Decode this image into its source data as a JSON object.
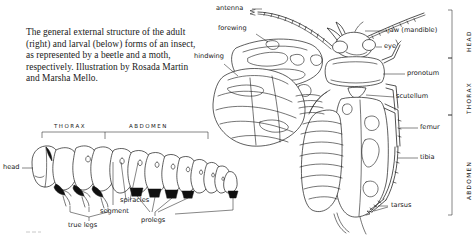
{
  "caption": {
    "text": "The general external structure of the adult (right) and larval (below) forms of an insect, as represented by a beetle and a moth, respectively. Illustration by Rosada Martin and Marsha Mello."
  },
  "figure": {
    "adult_beetle": {
      "labels_left": [
        {
          "id": "antenna",
          "text": "antenna"
        },
        {
          "id": "forewing",
          "text": "forewing"
        },
        {
          "id": "hindwing",
          "text": "hindwing"
        }
      ],
      "labels_right": [
        {
          "id": "jaw",
          "text": "jaw (mandible)"
        },
        {
          "id": "eye",
          "text": "eye"
        },
        {
          "id": "pronotum",
          "text": "pronotum"
        },
        {
          "id": "scutellum",
          "text": "scutellum"
        },
        {
          "id": "femur",
          "text": "femur"
        },
        {
          "id": "tibia",
          "text": "tibia"
        },
        {
          "id": "tarsus",
          "text": "tarsus"
        }
      ],
      "body_regions": [
        {
          "id": "head",
          "text": "HEAD"
        },
        {
          "id": "thorax",
          "text": "THORAX"
        },
        {
          "id": "abdomen",
          "text": "ABDOMEN"
        }
      ]
    },
    "larva": {
      "body_regions": [
        {
          "id": "thorax",
          "text": "THORAX"
        },
        {
          "id": "abdomen",
          "text": "ABDOMEN"
        }
      ],
      "labels": [
        {
          "id": "head",
          "text": "head"
        },
        {
          "id": "true-legs",
          "text": "true legs"
        },
        {
          "id": "segment",
          "text": "segment"
        },
        {
          "id": "spiracles",
          "text": "spiracles"
        },
        {
          "id": "prolegs",
          "text": "prolegs"
        }
      ]
    }
  },
  "colors": {
    "ink": "#1a1a1a",
    "page": "#ffffff",
    "text": "#161616"
  }
}
